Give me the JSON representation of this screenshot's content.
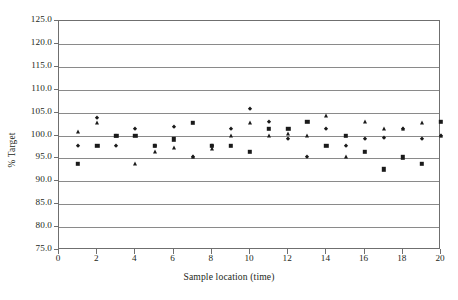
{
  "chart_data": {
    "type": "scatter",
    "title": "",
    "xlabel": "Sample location (time)",
    "ylabel": "% Target",
    "xlim": [
      0,
      20
    ],
    "ylim": [
      75.0,
      125.0
    ],
    "xticks": [
      0,
      2,
      4,
      6,
      8,
      10,
      12,
      14,
      16,
      18,
      20
    ],
    "xtick_labels": [
      "0",
      "2",
      "4",
      "6",
      "8",
      "10",
      "12",
      "14",
      "16",
      "18",
      "20"
    ],
    "yticks": [
      75.0,
      80.0,
      85.0,
      90.0,
      95.0,
      100.0,
      105.0,
      110.0,
      115.0,
      120.0,
      125.0
    ],
    "ytick_labels": [
      "75.0",
      "80.0",
      "85.0",
      "90.0",
      "95.0",
      "100.0",
      "105.0",
      "110.0",
      "115.0",
      "120.0",
      "125.0"
    ],
    "grid": true,
    "grid_axis": "y",
    "legend": "none",
    "marker_color": "#1a1a1a",
    "series": [
      {
        "name": "series-diamond",
        "marker": "diamond",
        "x": [
          1,
          2,
          3,
          4,
          5,
          6,
          7,
          8,
          9,
          10,
          11,
          12,
          13,
          14,
          15,
          16,
          17,
          18,
          19,
          20
        ],
        "values": [
          97.8,
          103.8,
          97.8,
          101.5,
          97.8,
          101.8,
          95.2,
          97.8,
          101.5,
          105.8,
          103.0,
          99.2,
          95.2,
          101.5,
          97.8,
          99.2,
          99.5,
          101.5,
          99.2,
          99.9
        ]
      },
      {
        "name": "series-square",
        "marker": "square",
        "x": [
          1,
          2,
          3,
          4,
          5,
          6,
          7,
          8,
          9,
          10,
          11,
          12,
          13,
          14,
          15,
          16,
          17,
          18,
          19,
          20
        ],
        "values": [
          93.8,
          97.8,
          99.9,
          99.9,
          97.8,
          99.2,
          102.8,
          97.8,
          97.8,
          96.5,
          101.5,
          101.5,
          103.0,
          97.8,
          99.9,
          96.5,
          92.6,
          95.2,
          93.8,
          103.0
        ]
      },
      {
        "name": "series-triangle",
        "marker": "triangle",
        "x": [
          1,
          2,
          3,
          4,
          5,
          6,
          7,
          8,
          9,
          10,
          11,
          12,
          13,
          14,
          15,
          16,
          17,
          18,
          19,
          20
        ],
        "values": [
          100.8,
          102.8,
          99.9,
          93.8,
          96.5,
          97.2,
          95.2,
          97.0,
          99.9,
          102.8,
          99.9,
          100.3,
          99.9,
          104.2,
          95.2,
          103.0,
          101.5,
          101.5,
          102.8,
          99.9
        ]
      }
    ]
  }
}
